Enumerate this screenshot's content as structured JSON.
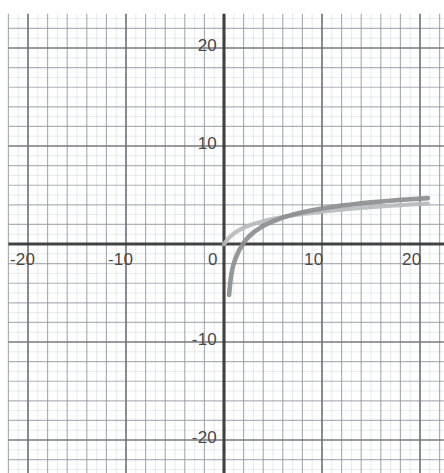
{
  "figure": {
    "kind": "graph-paper-plot",
    "background_color": "#ffffff",
    "paper_tint": "#fbfbfb"
  },
  "axes": {
    "axis_color": "#3a3a3a",
    "grid_minor_color": "#c9cdd4",
    "grid_major_color": "#8f959e",
    "x_axis_label": "",
    "y_axis_label": "",
    "x_ticks": [
      {
        "value": -20,
        "label": "-20"
      },
      {
        "value": -10,
        "label": "-10"
      },
      {
        "value": 0,
        "label": "0"
      },
      {
        "value": 10,
        "label": "10"
      },
      {
        "value": 20,
        "label": "20"
      }
    ],
    "y_ticks": [
      {
        "value": 20,
        "label": "20"
      },
      {
        "value": 10,
        "label": "10"
      },
      {
        "value": -10,
        "label": "-10"
      },
      {
        "value": -20,
        "label": "-20"
      }
    ]
  },
  "chart_data": {
    "type": "line",
    "title": "",
    "subtitle": "",
    "xlabel": "",
    "ylabel": "",
    "xlim": [
      -22.0,
      22.5
    ],
    "ylim": [
      -23.5,
      23.5
    ],
    "grid": true,
    "grid_minor_step": 1,
    "grid_major_step": 2,
    "legend": "none",
    "legend_position": "none",
    "annotations": [],
    "series": [
      {
        "name": "light-curve",
        "color": "#b9bcbe",
        "width": 4.2,
        "note": "logarithmic-type curve through the origin, rising to about 4.7 at x = 20",
        "x": [
          0.0,
          0.5,
          1.0,
          1.5,
          2.0,
          3.0,
          4.0,
          5.0,
          6.0,
          7.0,
          8.0,
          9.0,
          10.0,
          11.0,
          12.0,
          13.0,
          14.0,
          15.0,
          16.0,
          17.0,
          18.0,
          19.0,
          20.0,
          20.8
        ],
        "y": [
          0.0,
          0.63,
          1.07,
          1.4,
          1.66,
          2.05,
          2.33,
          2.56,
          2.75,
          2.91,
          3.06,
          3.18,
          3.3,
          3.41,
          3.5,
          3.6,
          3.68,
          3.76,
          3.83,
          3.9,
          3.97,
          4.03,
          4.09,
          4.13
        ]
      },
      {
        "name": "dark-curve",
        "color": "#8c8f93",
        "width": 4.6,
        "note": "logarithmic-type curve with a vertical asymptote near x = 0.45, crossing the x-axis near x = 2.2 and converging with the light curve near x = 20",
        "x": [
          0.52,
          0.6,
          0.7,
          0.85,
          1.0,
          1.2,
          1.5,
          2.0,
          2.2,
          2.5,
          3.0,
          4.0,
          5.0,
          6.0,
          7.0,
          8.0,
          9.0,
          10.0,
          11.0,
          12.0,
          13.0,
          14.0,
          15.0,
          16.0,
          17.0,
          18.0,
          19.0,
          20.0,
          20.8
        ],
        "y": [
          -5.2,
          -4.3,
          -3.4,
          -2.55,
          -2.0,
          -1.4,
          -0.72,
          0.1,
          0.37,
          0.72,
          1.18,
          1.85,
          2.32,
          2.7,
          3.0,
          3.25,
          3.45,
          3.63,
          3.78,
          3.92,
          4.04,
          4.15,
          4.25,
          4.34,
          4.42,
          4.5,
          4.57,
          4.63,
          4.68
        ]
      }
    ]
  }
}
